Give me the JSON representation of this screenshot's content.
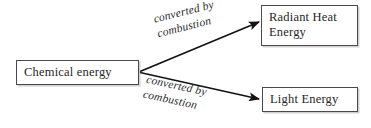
{
  "diagram": {
    "background_color": "#ffffff",
    "text_color": "#262626",
    "border_color": "#4a4a4a",
    "arrow_color": "#121212",
    "nodes": [
      {
        "id": "chemical-energy",
        "label": "Chemical energy",
        "role": "source"
      },
      {
        "id": "radiant-heat-energy",
        "label": "Radiant Heat\nEnergy",
        "role": "target"
      },
      {
        "id": "light-energy",
        "label": "Light Energy",
        "role": "target"
      }
    ],
    "edges": [
      {
        "id": "edge-upper",
        "from": "chemical-energy",
        "to": "radiant-heat-energy",
        "label": "converted by\ncombustion",
        "direction": "up-right"
      },
      {
        "id": "edge-lower",
        "from": "chemical-energy",
        "to": "light-energy",
        "label": "converted by\ncombustion",
        "direction": "down-right"
      }
    ]
  }
}
